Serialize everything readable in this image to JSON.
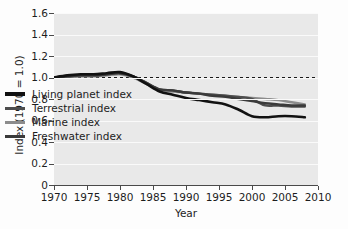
{
  "chart_data": {
    "type": "line",
    "title": "",
    "xlabel": "Year",
    "ylabel": "Index (1970 = 1.0)",
    "xlim": [
      1970,
      2010
    ],
    "ylim": [
      0,
      1.6
    ],
    "xticks": [
      "1970",
      "1975",
      "1980",
      "1985",
      "1990",
      "1995",
      "2000",
      "2005",
      "2010"
    ],
    "yticks": [
      "0",
      "0.2",
      "0.4",
      "0.6",
      "0.8",
      "1.0",
      "1.2",
      "1.4",
      "1.6"
    ],
    "grid": "horizontal-white-gridlines",
    "legend_position": "inside-left-center",
    "reference_line": {
      "value": 1.0,
      "style": "dashed",
      "color": "#1a1a1a"
    },
    "plot_background": "#e9e9e9",
    "x": [
      1970,
      1972,
      1974,
      1976,
      1978,
      1980,
      1982,
      1984,
      1986,
      1988,
      1990,
      1992,
      1994,
      1996,
      1998,
      2000,
      2002,
      2004,
      2006,
      2008
    ],
    "series": [
      {
        "name": "Living planet index",
        "color": "#111111",
        "width": 2.6,
        "values": [
          1.0,
          1.02,
          1.03,
          1.03,
          1.04,
          1.05,
          1.01,
          0.94,
          0.87,
          0.84,
          0.81,
          0.79,
          0.77,
          0.75,
          0.7,
          0.64,
          0.63,
          0.64,
          0.64,
          0.63
        ]
      },
      {
        "name": "Terrestrial index",
        "color": "#4d4d4d",
        "width": 2.4,
        "values": [
          1.0,
          1.01,
          1.02,
          1.02,
          1.03,
          1.04,
          1.01,
          0.95,
          0.89,
          0.88,
          0.86,
          0.85,
          0.84,
          0.83,
          0.82,
          0.8,
          0.74,
          0.74,
          0.73,
          0.73
        ]
      },
      {
        "name": "Marine index",
        "color": "#8c8c8c",
        "width": 2.4,
        "values": [
          1.0,
          1.0,
          1.01,
          1.01,
          1.02,
          1.03,
          1.0,
          0.94,
          0.88,
          0.87,
          0.86,
          0.85,
          0.84,
          0.83,
          0.82,
          0.81,
          0.8,
          0.79,
          0.77,
          0.75
        ]
      },
      {
        "name": "Freshwater index",
        "color": "#3a3a3a",
        "width": 2.4,
        "values": [
          1.0,
          1.01,
          1.02,
          1.02,
          1.03,
          1.04,
          1.01,
          0.95,
          0.89,
          0.88,
          0.86,
          0.85,
          0.83,
          0.82,
          0.8,
          0.78,
          0.76,
          0.75,
          0.74,
          0.74
        ]
      }
    ]
  },
  "legend": {
    "items": [
      {
        "label": "Living planet index",
        "color": "#111111"
      },
      {
        "label": "Terrestrial index",
        "color": "#4d4d4d"
      },
      {
        "label": "Marine index",
        "color": "#8c8c8c"
      },
      {
        "label": "Freshwater index",
        "color": "#3a3a3a"
      }
    ]
  }
}
